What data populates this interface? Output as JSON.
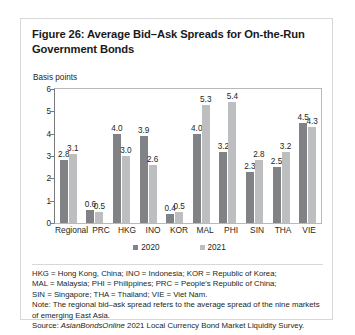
{
  "figure": {
    "title": "Figure 26: Average Bid–Ask Spreads for On-the-Run Government Bonds",
    "axis_unit_label": "Basis points"
  },
  "legend": {
    "items": [
      {
        "label": "2020",
        "color": "#808285"
      },
      {
        "label": "2021",
        "color": "#bcbec0"
      }
    ]
  },
  "notes": {
    "line1": "HKG = Hong Kong, China; INO = Indonesia; KOR = Republic of Korea;",
    "line2": "MAL = Malaysia; PHI = Philippines; PRC = People's Republic of China;",
    "line3": "SIN = Singapore; THA = Thailand; VIE = Viet Nam.",
    "note_label": "Note:",
    "note_text": " The regional bid–ask spread refers to the average spread of the nine markets of emerging East Asia.",
    "source_label": "Source:",
    "source_italic": " AsianBondsOnline",
    "source_rest": " 2021 Local Currency Bond Market Liquidity Survey."
  },
  "chart_data": {
    "type": "bar",
    "title": "Figure 26: Average Bid–Ask Spreads for On-the-Run Government Bonds",
    "xlabel": "",
    "ylabel": "Basis points",
    "ylim": [
      0,
      6
    ],
    "yticks": [
      0,
      1,
      2,
      3,
      4,
      5,
      6
    ],
    "grid": false,
    "legend_position": "bottom-center",
    "categories": [
      "Regional",
      "PRC",
      "HKG",
      "INO",
      "KOR",
      "MAL",
      "PHI",
      "SIN",
      "THA",
      "VIE"
    ],
    "series": [
      {
        "name": "2020",
        "color": "#808285",
        "values": [
          2.8,
          0.6,
          4.0,
          3.9,
          0.4,
          4.0,
          3.2,
          2.3,
          2.5,
          4.5
        ]
      },
      {
        "name": "2021",
        "color": "#bcbec0",
        "values": [
          3.1,
          0.5,
          3.0,
          2.6,
          0.5,
          5.3,
          5.4,
          2.8,
          3.2,
          4.3
        ]
      }
    ]
  }
}
